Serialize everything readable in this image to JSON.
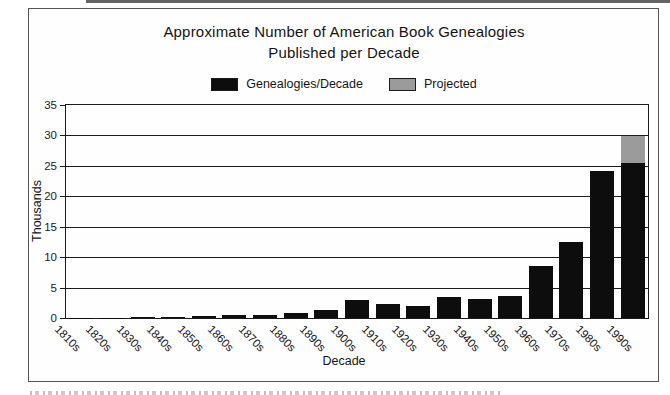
{
  "page": {
    "title_line1": "Approximate Number of American Book Genealogies",
    "title_line2": "Published per Decade",
    "y_axis_title": "Thousands",
    "x_axis_title": "Decade"
  },
  "legend": {
    "items": [
      {
        "label": "Genealogies/Decade",
        "color": "#0d0d0d"
      },
      {
        "label": "Projected",
        "color": "#9b9b9b"
      }
    ]
  },
  "chart_data": {
    "type": "bar",
    "title": "Approximate Number of American Book Genealogies Published per Decade",
    "xlabel": "Decade",
    "ylabel": "Thousands",
    "ylim": [
      0,
      35
    ],
    "yticks": [
      0,
      5,
      10,
      15,
      20,
      25,
      30,
      35
    ],
    "grid": true,
    "legend_position": "top",
    "stacked": true,
    "categories": [
      "1810s",
      "1820s",
      "1830s",
      "1840s",
      "1850s",
      "1860s",
      "1870s",
      "1880s",
      "1890s",
      "1900s",
      "1910s",
      "1920s",
      "1930s",
      "1940s",
      "1950s",
      "1960s",
      "1970s",
      "1980s",
      "1990s"
    ],
    "series": [
      {
        "name": "Genealogies/Decade",
        "color": "#0d0d0d",
        "values": [
          0.05,
          0.05,
          0.1,
          0.2,
          0.3,
          0.5,
          0.5,
          0.8,
          1.3,
          2.9,
          2.3,
          1.9,
          3.5,
          3.1,
          3.6,
          8.5,
          12.5,
          24.2,
          25.5
        ]
      },
      {
        "name": "Projected",
        "color": "#9b9b9b",
        "values": [
          0,
          0,
          0,
          0,
          0,
          0,
          0,
          0,
          0,
          0,
          0,
          0,
          0,
          0,
          0,
          0,
          0,
          0,
          4.5
        ]
      }
    ]
  }
}
